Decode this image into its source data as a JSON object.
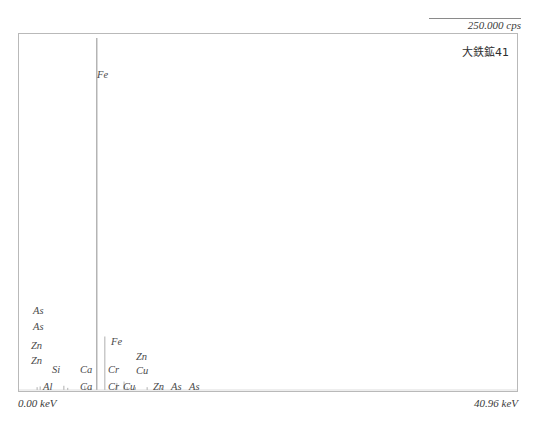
{
  "header": {
    "cps_label": "250.000 cps"
  },
  "sample": {
    "name": "大鉄鉱41"
  },
  "axis": {
    "left_label": "0.00 keV",
    "right_label": "40.96 keV"
  },
  "colors": {
    "frame": "#b9b9b9",
    "trace": "#9a9a9a",
    "text": "#3a3a3a",
    "background": "#ffffff"
  },
  "peak_labels": [
    {
      "text": "Fe",
      "x": 78,
      "y": 36
    },
    {
      "text": "As",
      "x": 14,
      "y": 272
    },
    {
      "text": "As",
      "x": 14,
      "y": 288
    },
    {
      "text": "Zn",
      "x": 12,
      "y": 307
    },
    {
      "text": "Zn",
      "x": 12,
      "y": 322
    },
    {
      "text": "Si",
      "x": 33,
      "y": 331
    },
    {
      "text": "Ca",
      "x": 61,
      "y": 331
    },
    {
      "text": "Cr",
      "x": 89,
      "y": 331
    },
    {
      "text": "Fe",
      "x": 92,
      "y": 303
    },
    {
      "text": "Zn",
      "x": 117,
      "y": 318
    },
    {
      "text": "Cu",
      "x": 117,
      "y": 332
    },
    {
      "text": "Al",
      "x": 24,
      "y": 348
    },
    {
      "text": "Ca",
      "x": 61,
      "y": 348
    },
    {
      "text": "Cr",
      "x": 89,
      "y": 348
    },
    {
      "text": "Cu",
      "x": 104,
      "y": 348
    },
    {
      "text": "Zn",
      "x": 134,
      "y": 348
    },
    {
      "text": "As",
      "x": 152,
      "y": 348
    },
    {
      "text": "As",
      "x": 170,
      "y": 348
    }
  ],
  "chart_data": {
    "type": "line",
    "title": "大鉄鉱41",
    "xlabel": "keV",
    "ylabel": "cps",
    "xlim": [
      0.0,
      40.96
    ],
    "ylim": [
      0,
      250.0
    ],
    "grid": false,
    "legend": null,
    "y_max_label": "250.000 cps",
    "x_min_label": "0.00 keV",
    "x_max_label": "40.96 keV",
    "peaks": [
      {
        "element": "Al",
        "energy_keV": 1.49,
        "intensity_cps": 2.0
      },
      {
        "element": "Si",
        "energy_keV": 1.74,
        "intensity_cps": 2.5
      },
      {
        "element": "Ca",
        "energy_keV": 3.69,
        "intensity_cps": 3.0
      },
      {
        "element": "Ca",
        "energy_keV": 4.01,
        "intensity_cps": 1.5
      },
      {
        "element": "Cr",
        "energy_keV": 5.41,
        "intensity_cps": 3.0
      },
      {
        "element": "Cr",
        "energy_keV": 5.95,
        "intensity_cps": 1.5
      },
      {
        "element": "Fe",
        "energy_keV": 6.4,
        "intensity_cps": 250.0
      },
      {
        "element": "Fe",
        "energy_keV": 7.06,
        "intensity_cps": 38.0
      },
      {
        "element": "Cu",
        "energy_keV": 8.05,
        "intensity_cps": 5.0
      },
      {
        "element": "Cu",
        "energy_keV": 8.9,
        "intensity_cps": 2.0
      },
      {
        "element": "Zn",
        "energy_keV": 8.64,
        "intensity_cps": 6.0
      },
      {
        "element": "Zn",
        "energy_keV": 9.57,
        "intensity_cps": 2.0
      },
      {
        "element": "As",
        "energy_keV": 10.54,
        "intensity_cps": 2.0
      },
      {
        "element": "As",
        "energy_keV": 11.73,
        "intensity_cps": 1.5
      }
    ],
    "series": [
      {
        "name": "spectrum",
        "x": [
          0.0,
          1.49,
          1.74,
          3.69,
          4.01,
          5.41,
          5.95,
          6.4,
          7.06,
          8.05,
          8.64,
          8.9,
          9.57,
          10.54,
          11.73,
          40.96
        ],
        "y": [
          0.0,
          2.0,
          2.5,
          3.0,
          1.5,
          3.0,
          1.5,
          250.0,
          38.0,
          5.0,
          6.0,
          2.0,
          2.0,
          2.0,
          1.5,
          0.0
        ]
      }
    ]
  }
}
